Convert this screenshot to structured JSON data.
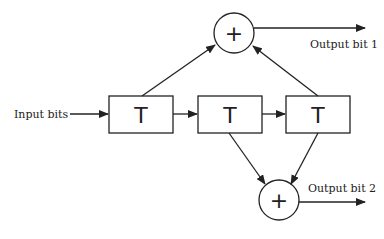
{
  "diagram": {
    "type": "convolutional-encoder",
    "input_label": "Input bits",
    "registers": [
      {
        "label": "T"
      },
      {
        "label": "T"
      },
      {
        "label": "T"
      }
    ],
    "adders": [
      {
        "symbol": "+",
        "output_label": "Output bit 1"
      },
      {
        "symbol": "+",
        "output_label": "Output bit 2"
      }
    ],
    "connections": [
      {
        "from": "input",
        "to": "register-1"
      },
      {
        "from": "register-1",
        "to": "register-2"
      },
      {
        "from": "register-2",
        "to": "register-3"
      },
      {
        "from": "register-1",
        "to": "adder-1"
      },
      {
        "from": "register-3",
        "to": "adder-1"
      },
      {
        "from": "register-2",
        "to": "adder-2"
      },
      {
        "from": "register-3",
        "to": "adder-2"
      },
      {
        "from": "adder-1",
        "to": "output-1"
      },
      {
        "from": "adder-2",
        "to": "output-2"
      }
    ],
    "colors": {
      "stroke": "#222222",
      "background": "#ffffff"
    }
  }
}
